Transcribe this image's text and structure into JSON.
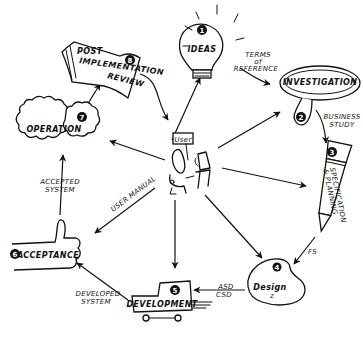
{
  "diagram": {
    "center": {
      "label": "User"
    },
    "stages": [
      {
        "number": "1",
        "label": "IDEAS",
        "shape": "lightbulb-icon"
      },
      {
        "number": "2",
        "label": "INVESTIGATION",
        "shape": "magnifying-glass-icon"
      },
      {
        "number": "3",
        "label": "SPECIFICATION & PLANNING",
        "label_line1": "SPECIFICATION",
        "label_line2": "& PLANNING",
        "shape": "pencil-icon"
      },
      {
        "number": "4",
        "label": "Design",
        "shape": "palette-icon"
      },
      {
        "number": "5",
        "label": "DEVELOPMENT",
        "shape": "truck-icon"
      },
      {
        "number": "6",
        "label": "ACCEPTANCE",
        "shape": "thumbs-up-icon"
      },
      {
        "number": "7",
        "label": "OPERATION",
        "shape": "gears-icon"
      },
      {
        "number": "8",
        "label": "POST IMPLEMENTATION REVIEW",
        "label_line1": "POST",
        "label_line2": "IMPLEMENTATION",
        "label_line3": "REVIEW",
        "shape": "document-icon"
      }
    ],
    "connector_labels": {
      "terms_of_reference": {
        "line1": "TERMS",
        "line2": "of",
        "line3": "REFERENCE"
      },
      "business_study": {
        "line1": "BUSINESS",
        "line2": "STUDY"
      },
      "fs": "FS",
      "asd_csd": {
        "line1": "ASD",
        "line2": "CSD"
      },
      "developed_system": {
        "line1": "DEVELOPED",
        "line2": "SYSTEM"
      },
      "accepted_system": {
        "line1": "ACCEPTED",
        "line2": "SYSTEM"
      },
      "user_manual": "USER MANUAL"
    },
    "colors": {
      "ink": "#111111",
      "paper": "#ffffff"
    }
  }
}
